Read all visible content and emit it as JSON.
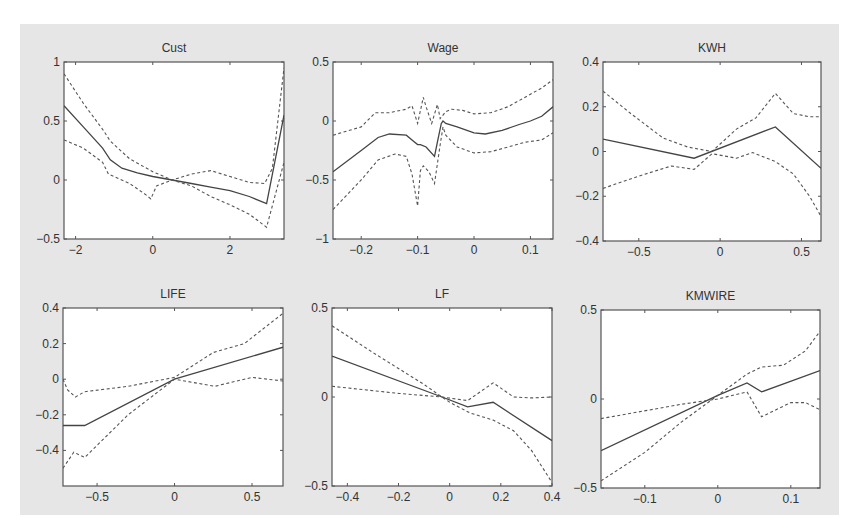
{
  "chart_data": [
    {
      "type": "line",
      "title": "Cust",
      "xlim": [
        -2.3,
        3.4
      ],
      "ylim": [
        -0.5,
        1
      ],
      "xticks": [
        -2,
        0,
        2
      ],
      "xtick_labels": [
        "−2",
        "0",
        "2"
      ],
      "yticks": [
        -0.5,
        0,
        0.5,
        1
      ],
      "ytick_labels": [
        "−0.5",
        "0",
        "0.5",
        "1"
      ],
      "box": [
        64,
        62,
        284,
        239
      ],
      "series": [
        {
          "name": "estimate",
          "style": "solid",
          "x": [
            -2.3,
            -1.8,
            -1.3,
            -1.1,
            -0.8,
            -0.4,
            0,
            0.5,
            1,
            1.5,
            2,
            2.5,
            2.95,
            3.4
          ],
          "y": [
            0.63,
            0.45,
            0.27,
            0.17,
            0.1,
            0.06,
            0.03,
            0.0,
            -0.03,
            -0.06,
            -0.09,
            -0.14,
            -0.2,
            0.55
          ]
        },
        {
          "name": "upper band",
          "style": "dashed",
          "x": [
            -2.3,
            -1.8,
            -1.3,
            -1.1,
            -0.6,
            0,
            0.5,
            1,
            1.5,
            2,
            2.5,
            2.9,
            3.1,
            3.4
          ],
          "y": [
            0.9,
            0.65,
            0.43,
            0.33,
            0.18,
            0.07,
            0.0,
            0.05,
            0.08,
            0.03,
            -0.02,
            -0.03,
            0.1,
            0.95
          ]
        },
        {
          "name": "lower band",
          "style": "dashed",
          "x": [
            -2.3,
            -1.8,
            -1.3,
            -1.15,
            -0.6,
            -0.2,
            -0.05,
            0.1,
            0.5,
            1,
            1.5,
            2,
            2.5,
            2.95,
            3.4
          ],
          "y": [
            0.34,
            0.27,
            0.15,
            0.05,
            -0.03,
            -0.12,
            -0.16,
            -0.05,
            0.0,
            -0.05,
            -0.14,
            -0.21,
            -0.29,
            -0.4,
            0.15
          ]
        }
      ]
    },
    {
      "type": "line",
      "title": "Wage",
      "xlim": [
        -0.25,
        0.14
      ],
      "ylim": [
        -1,
        0.5
      ],
      "xticks": [
        -0.2,
        -0.1,
        0,
        0.1
      ],
      "xtick_labels": [
        "−0.2",
        "−0.1",
        "0",
        "0.1"
      ],
      "yticks": [
        -1,
        -0.5,
        0,
        0.5
      ],
      "ytick_labels": [
        "−1",
        "−0.5",
        "0",
        "0.5"
      ],
      "box": [
        333,
        62,
        553,
        239
      ],
      "series": [
        {
          "name": "estimate",
          "style": "solid",
          "x": [
            -0.25,
            -0.2,
            -0.17,
            -0.15,
            -0.12,
            -0.11,
            -0.1,
            -0.095,
            -0.085,
            -0.07,
            -0.065,
            -0.058,
            -0.055,
            -0.05,
            -0.03,
            0,
            0.02,
            0.05,
            0.08,
            0.1,
            0.12,
            0.14
          ],
          "y": [
            -0.43,
            -0.25,
            -0.14,
            -0.11,
            -0.12,
            -0.16,
            -0.2,
            -0.2,
            -0.22,
            -0.3,
            -0.18,
            -0.02,
            0.0,
            -0.02,
            -0.05,
            -0.1,
            -0.11,
            -0.08,
            -0.03,
            0.0,
            0.04,
            0.12
          ]
        },
        {
          "name": "upper band",
          "style": "dashed",
          "x": [
            -0.25,
            -0.2,
            -0.175,
            -0.15,
            -0.12,
            -0.11,
            -0.1,
            -0.09,
            -0.085,
            -0.075,
            -0.065,
            -0.06,
            -0.05,
            -0.04,
            -0.02,
            0,
            0.03,
            0.06,
            0.09,
            0.12,
            0.14
          ],
          "y": [
            -0.12,
            -0.05,
            0.07,
            0.07,
            0.1,
            0.13,
            -0.02,
            0.2,
            0.12,
            -0.02,
            0.14,
            0.02,
            0.08,
            0.1,
            0.09,
            0.06,
            0.07,
            0.12,
            0.2,
            0.28,
            0.35
          ]
        },
        {
          "name": "lower band",
          "style": "dashed",
          "x": [
            -0.25,
            -0.2,
            -0.17,
            -0.14,
            -0.12,
            -0.11,
            -0.1,
            -0.095,
            -0.09,
            -0.08,
            -0.07,
            -0.06,
            -0.055,
            -0.05,
            -0.03,
            0,
            0.03,
            0.06,
            0.09,
            0.12,
            0.14
          ],
          "y": [
            -0.75,
            -0.5,
            -0.33,
            -0.28,
            -0.3,
            -0.45,
            -0.72,
            -0.42,
            -0.38,
            -0.43,
            -0.53,
            -0.2,
            -0.05,
            -0.12,
            -0.22,
            -0.27,
            -0.26,
            -0.22,
            -0.18,
            -0.16,
            -0.1
          ]
        }
      ]
    },
    {
      "type": "line",
      "title": "KWH",
      "xlim": [
        -0.72,
        0.62
      ],
      "ylim": [
        -0.4,
        0.4
      ],
      "xticks": [
        -0.5,
        0,
        0.5
      ],
      "xtick_labels": [
        "−0.5",
        "0",
        "0.5"
      ],
      "yticks": [
        -0.4,
        -0.2,
        0,
        0.2,
        0.4
      ],
      "ytick_labels": [
        "−0.4",
        "−0.2",
        "0",
        "0.2",
        "0.4"
      ],
      "box": [
        603,
        62,
        821,
        241
      ],
      "series": [
        {
          "name": "estimate",
          "style": "solid",
          "x": [
            -0.72,
            -0.16,
            0.34,
            0.62
          ],
          "y": [
            0.055,
            -0.03,
            0.11,
            -0.075
          ]
        },
        {
          "name": "upper band",
          "style": "dashed",
          "x": [
            -0.72,
            -0.55,
            -0.35,
            -0.2,
            -0.05,
            0.1,
            0.22,
            0.34,
            0.45,
            0.55,
            0.62
          ],
          "y": [
            0.27,
            0.17,
            0.06,
            0.02,
            0.0,
            0.1,
            0.15,
            0.26,
            0.17,
            0.155,
            0.155
          ]
        },
        {
          "name": "lower band",
          "style": "dashed",
          "x": [
            -0.72,
            -0.5,
            -0.3,
            -0.16,
            -0.05,
            0.1,
            0.2,
            0.34,
            0.45,
            0.55,
            0.62
          ],
          "y": [
            -0.165,
            -0.11,
            -0.065,
            -0.08,
            -0.01,
            -0.03,
            -0.005,
            -0.045,
            -0.1,
            -0.2,
            -0.29
          ]
        }
      ]
    },
    {
      "type": "line",
      "title": "LIFE",
      "xlim": [
        -0.72,
        0.7
      ],
      "ylim": [
        -0.6,
        0.4
      ],
      "xticks": [
        -0.5,
        0,
        0.5
      ],
      "xtick_labels": [
        "−0.5",
        "0",
        "0.5"
      ],
      "yticks": [
        -0.4,
        -0.2,
        0,
        0.2,
        0.4
      ],
      "ytick_labels": [
        "−0.4",
        "−0.2",
        "0",
        "0.2",
        "0.4"
      ],
      "box": [
        63,
        308,
        283,
        486
      ],
      "series": [
        {
          "name": "estimate",
          "style": "solid",
          "x": [
            -0.72,
            -0.58,
            0,
            0.7
          ],
          "y": [
            -0.26,
            -0.26,
            0.0,
            0.18
          ]
        },
        {
          "name": "upper band",
          "style": "dashed",
          "x": [
            -0.72,
            -0.69,
            -0.64,
            -0.58,
            -0.3,
            0,
            0.25,
            0.45,
            0.7
          ],
          "y": [
            0.0,
            -0.06,
            -0.1,
            -0.07,
            -0.04,
            0.01,
            0.15,
            0.2,
            0.37
          ]
        },
        {
          "name": "lower band",
          "style": "dashed",
          "x": [
            -0.72,
            -0.65,
            -0.58,
            -0.3,
            0,
            0.26,
            0.5,
            0.7
          ],
          "y": [
            -0.5,
            -0.41,
            -0.44,
            -0.2,
            0.0,
            -0.04,
            0.01,
            -0.01
          ]
        }
      ]
    },
    {
      "type": "line",
      "title": "LF",
      "xlim": [
        -0.46,
        0.4
      ],
      "ylim": [
        -0.5,
        0.5
      ],
      "xticks": [
        -0.4,
        -0.2,
        0,
        0.2,
        0.4
      ],
      "xtick_labels": [
        "−0.4",
        "−0.2",
        "0",
        "0.2",
        "0.4"
      ],
      "yticks": [
        -0.5,
        0,
        0.5
      ],
      "ytick_labels": [
        "−0.5",
        "0",
        "0.5"
      ],
      "box": [
        332,
        308,
        552,
        486
      ],
      "series": [
        {
          "name": "estimate",
          "style": "solid",
          "x": [
            -0.46,
            -0.03,
            0.07,
            0.17,
            0.4
          ],
          "y": [
            0.23,
            0.0,
            -0.055,
            -0.03,
            -0.245
          ]
        },
        {
          "name": "upper band",
          "style": "dashed",
          "x": [
            -0.46,
            -0.2,
            -0.03,
            0.07,
            0.17,
            0.25,
            0.32,
            0.4
          ],
          "y": [
            0.06,
            0.02,
            0.0,
            -0.02,
            0.08,
            0.0,
            -0.005,
            0.0
          ]
        },
        {
          "name": "lower band",
          "style": "dashed",
          "x": [
            -0.46,
            -0.3,
            -0.1,
            0.0,
            0.08,
            0.17,
            0.25,
            0.32,
            0.4
          ],
          "y": [
            0.4,
            0.25,
            0.07,
            -0.03,
            -0.09,
            -0.13,
            -0.19,
            -0.3,
            -0.48
          ]
        }
      ]
    },
    {
      "type": "line",
      "title": "KMWIRE",
      "xlim": [
        -0.16,
        0.14
      ],
      "ylim": [
        -0.5,
        0.5
      ],
      "xticks": [
        -0.1,
        0,
        0.1
      ],
      "xtick_labels": [
        "−0.1",
        "0",
        "0.1"
      ],
      "yticks": [
        -0.5,
        0,
        0.5
      ],
      "ytick_labels": [
        "−0.5",
        "0",
        "0.5"
      ],
      "box": [
        601,
        310,
        820,
        488
      ],
      "series": [
        {
          "name": "estimate",
          "style": "solid",
          "x": [
            -0.16,
            0.0,
            0.04,
            0.06,
            0.14
          ],
          "y": [
            -0.29,
            0.02,
            0.09,
            0.04,
            0.16
          ]
        },
        {
          "name": "upper band",
          "style": "dashed",
          "x": [
            -0.16,
            -0.05,
            0.0,
            0.04,
            0.06,
            0.1,
            0.12,
            0.14
          ],
          "y": [
            -0.11,
            -0.03,
            0.0,
            0.04,
            -0.1,
            -0.02,
            -0.02,
            -0.06
          ]
        },
        {
          "name": "lower band",
          "style": "dashed",
          "x": [
            -0.16,
            -0.1,
            -0.05,
            0.0,
            0.04,
            0.06,
            0.09,
            0.12,
            0.14
          ],
          "y": [
            -0.46,
            -0.3,
            -0.13,
            0.02,
            0.14,
            0.18,
            0.19,
            0.27,
            0.38
          ]
        }
      ]
    }
  ]
}
